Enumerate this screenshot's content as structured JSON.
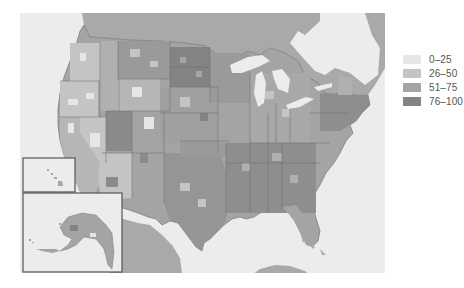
{
  "map": {
    "type": "choropleth",
    "region": "United States (by county)",
    "insets": [
      "Alaska",
      "Hawaii"
    ],
    "colors": {
      "water": "#ececec",
      "neighbor_land": "#a9a9a9",
      "state_border": "#6a6a6a",
      "inset_border": "#555555"
    }
  },
  "legend": {
    "items": [
      {
        "label": "0–25",
        "color": "#e6e6e6"
      },
      {
        "label": "26–50",
        "color": "#c4c4c4"
      },
      {
        "label": "51–75",
        "color": "#a4a4a4"
      },
      {
        "label": "76–100",
        "color": "#838383"
      }
    ]
  }
}
